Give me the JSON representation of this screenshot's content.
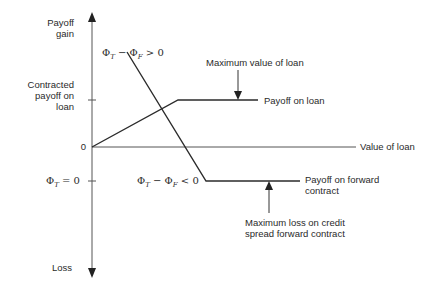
{
  "axes": {
    "y_top_label": [
      "Payoff",
      "gain"
    ],
    "y_bottom_label": "Loss",
    "x_label": "Value of loan",
    "origin_label": "0",
    "contracted_payoff_label": [
      "Contracted",
      "payoff on",
      "loan"
    ],
    "phi_zero_label": "Φ_T = 0"
  },
  "annotations": {
    "positive_spread": "Φ_T − Φ_F > 0",
    "negative_spread": "Φ_T − Φ_F < 0",
    "max_value_loan": "Maximum value of loan",
    "payoff_loan": "Payoff on loan",
    "payoff_forward": [
      "Payoff on forward",
      "contract"
    ],
    "max_loss_forward": [
      "Maximum loss on credit",
      "spread forward contract"
    ]
  },
  "colors": {
    "line": "#2b2b2b",
    "axis": "#555555"
  }
}
